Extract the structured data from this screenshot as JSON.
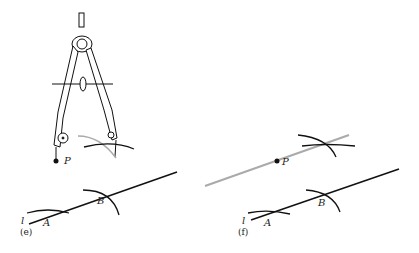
{
  "figure": {
    "panels": [
      {
        "id": "e",
        "caption": "(e)",
        "labels": {
          "line": "l",
          "point_a": "A",
          "point_b": "B",
          "point_p": "P"
        }
      },
      {
        "id": "f",
        "caption": "(f)",
        "labels": {
          "line": "l",
          "point_a": "A",
          "point_b": "B",
          "point_p": "P"
        }
      }
    ],
    "colors": {
      "ink": "#111111",
      "construction_line": "#b0b0b0"
    }
  }
}
